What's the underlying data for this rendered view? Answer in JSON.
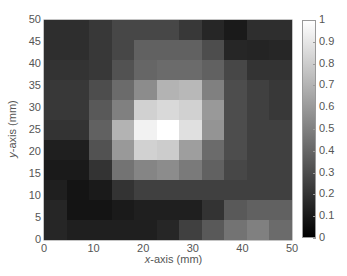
{
  "chart_data": {
    "type": "heatmap",
    "title": "",
    "xlabel": "x-axis (mm)",
    "ylabel": "y-axis (mm)",
    "xlabel_var": "x",
    "xlabel_rest": "-axis (mm)",
    "ylabel_var": "y",
    "ylabel_rest": "-axis (mm)",
    "xlim": [
      0,
      50
    ],
    "ylim": [
      0,
      50
    ],
    "x": [
      0,
      5,
      10,
      15,
      20,
      25,
      30,
      35,
      40,
      45,
      50
    ],
    "y": [
      50,
      45,
      40,
      35,
      30,
      25,
      20,
      15,
      10,
      5,
      0
    ],
    "xticks": [
      "0",
      "10",
      "20",
      "30",
      "40",
      "50"
    ],
    "yticks": [
      "0",
      "5",
      "10",
      "15",
      "20",
      "25",
      "30",
      "35",
      "40",
      "45",
      "50"
    ],
    "colormap": "gray",
    "colorbar": {
      "range": [
        0,
        1
      ],
      "ticks": [
        "0",
        "0.1",
        "0.2",
        "0.3",
        "0.4",
        "0.5",
        "0.6",
        "0.7",
        "0.8",
        "0.9",
        "1"
      ],
      "position": "right"
    },
    "values": [
      [
        0.18,
        0.18,
        0.22,
        0.28,
        0.28,
        0.28,
        0.22,
        0.15,
        0.1,
        0.18,
        0.18
      ],
      [
        0.18,
        0.18,
        0.22,
        0.28,
        0.38,
        0.38,
        0.38,
        0.3,
        0.15,
        0.14,
        0.15
      ],
      [
        0.2,
        0.2,
        0.22,
        0.32,
        0.4,
        0.42,
        0.42,
        0.38,
        0.28,
        0.2,
        0.2
      ],
      [
        0.22,
        0.22,
        0.3,
        0.42,
        0.55,
        0.7,
        0.72,
        0.5,
        0.3,
        0.25,
        0.22
      ],
      [
        0.22,
        0.22,
        0.35,
        0.5,
        0.82,
        0.85,
        0.82,
        0.6,
        0.3,
        0.25,
        0.22
      ],
      [
        0.2,
        0.2,
        0.38,
        0.7,
        0.95,
        1.0,
        0.88,
        0.58,
        0.3,
        0.25,
        0.25
      ],
      [
        0.12,
        0.12,
        0.32,
        0.6,
        0.82,
        0.8,
        0.62,
        0.42,
        0.3,
        0.25,
        0.25
      ],
      [
        0.1,
        0.1,
        0.2,
        0.45,
        0.52,
        0.55,
        0.48,
        0.38,
        0.28,
        0.25,
        0.25
      ],
      [
        0.12,
        0.08,
        0.1,
        0.2,
        0.25,
        0.25,
        0.25,
        0.25,
        0.25,
        0.25,
        0.25
      ],
      [
        0.15,
        0.08,
        0.08,
        0.1,
        0.12,
        0.12,
        0.12,
        0.2,
        0.35,
        0.38,
        0.38
      ],
      [
        0.15,
        0.12,
        0.12,
        0.12,
        0.12,
        0.15,
        0.25,
        0.35,
        0.45,
        0.5,
        0.42
      ]
    ],
    "grid": false
  }
}
